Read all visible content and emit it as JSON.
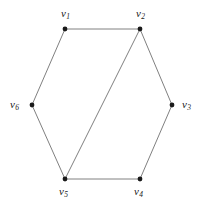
{
  "figure": {
    "background_color": "#ffffff",
    "width": 206,
    "height": 215,
    "edge_color": "#808080",
    "vertex_color": "#1a1a1a",
    "label_color": "#1a1a1a"
  },
  "graph": {
    "type": "undirected-graph",
    "vertex_count": 6,
    "edge_count": 7,
    "vertices": [
      {
        "id": "v1",
        "name": "v",
        "subscript": "1",
        "x": 65,
        "y": 29,
        "label_x": 61,
        "label_y": 8,
        "label_position": "above"
      },
      {
        "id": "v2",
        "name": "v",
        "subscript": "2",
        "x": 140,
        "y": 29,
        "label_x": 136,
        "label_y": 8,
        "label_position": "above"
      },
      {
        "id": "v3",
        "name": "v",
        "subscript": "3",
        "x": 172,
        "y": 105,
        "label_x": 182,
        "label_y": 99,
        "label_position": "right"
      },
      {
        "id": "v4",
        "name": "v",
        "subscript": "4",
        "x": 140,
        "y": 179,
        "label_x": 134,
        "label_y": 186,
        "label_position": "below"
      },
      {
        "id": "v5",
        "name": "v",
        "subscript": "5",
        "x": 65,
        "y": 179,
        "label_x": 59,
        "label_y": 186,
        "label_position": "below"
      },
      {
        "id": "v6",
        "name": "v",
        "subscript": "6",
        "x": 32,
        "y": 105,
        "label_x": 10,
        "label_y": 99,
        "label_position": "left"
      }
    ],
    "edges": [
      {
        "id": "e1",
        "from": "v1",
        "to": "v2",
        "kind": "hexagon-side"
      },
      {
        "id": "e2",
        "from": "v2",
        "to": "v3",
        "kind": "hexagon-side"
      },
      {
        "id": "e3",
        "from": "v3",
        "to": "v4",
        "kind": "hexagon-side"
      },
      {
        "id": "e4",
        "from": "v4",
        "to": "v5",
        "kind": "hexagon-side"
      },
      {
        "id": "e5",
        "from": "v5",
        "to": "v6",
        "kind": "hexagon-side"
      },
      {
        "id": "e6",
        "from": "v6",
        "to": "v1",
        "kind": "hexagon-side"
      },
      {
        "id": "e7",
        "from": "v2",
        "to": "v5",
        "kind": "chord"
      }
    ]
  }
}
